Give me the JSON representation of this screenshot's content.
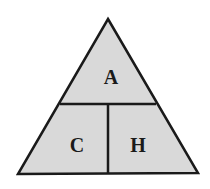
{
  "diagram": {
    "type": "formula-triangle",
    "colors": {
      "fill": "#d9d9d9",
      "stroke": "#1a1a1a",
      "background": "#ffffff"
    },
    "sections": {
      "top": "A",
      "bottom_left": "C",
      "bottom_right": "H"
    }
  }
}
